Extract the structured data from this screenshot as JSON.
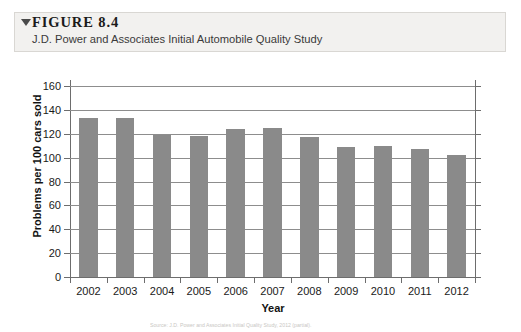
{
  "figure": {
    "marker_icon": "triangle-down-icon",
    "number_label": "FIGURE 8.4",
    "caption": "J.D. Power and Associates Initial Automobile Quality Study"
  },
  "source_note": "Source: J.D. Power and Associates Initial Quality Study, 2012 (partial).",
  "colors": {
    "bar_fill": "#8a8a8a",
    "axis": "#6d6d6d",
    "gridline": "#8d8d8d",
    "header_background": "#f2f1ef",
    "header_border": "#d9d7d3",
    "text": "#1a1a1a"
  },
  "chart_data": {
    "type": "bar",
    "title": "J.D. Power and Associates Initial Automobile Quality Study",
    "xlabel": "Year",
    "ylabel": "Problems per 100 cars sold",
    "categories": [
      "2002",
      "2003",
      "2004",
      "2005",
      "2006",
      "2007",
      "2008",
      "2009",
      "2010",
      "2011",
      "2012"
    ],
    "values": [
      133,
      133,
      119,
      118,
      124,
      125,
      117,
      109,
      110,
      107,
      102
    ],
    "ylim": [
      0,
      160
    ],
    "ytick_values": [
      0,
      20,
      40,
      60,
      80,
      100,
      120,
      140,
      160
    ],
    "ytick_labels": [
      "0",
      "20",
      "40",
      "60",
      "80",
      "100",
      "120",
      "140",
      "160"
    ],
    "grid": true,
    "legend": false,
    "legend_position": "none"
  }
}
